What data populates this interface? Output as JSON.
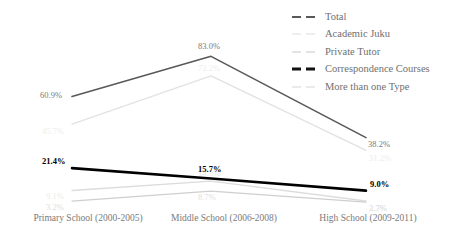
{
  "chart_data": {
    "type": "line",
    "title": "",
    "subtitle": "",
    "xlabel": "",
    "ylabel": "",
    "grid": false,
    "legend_position": "top-right",
    "ylim": [
      0,
      100
    ],
    "categories": [
      "Primary School (2000-2005)",
      "Middle School (2006-2008)",
      "High School (2009-2011)"
    ],
    "series": [
      {
        "name": "Total",
        "color": "#595959",
        "width": 1.6,
        "values": [
          60.9,
          83.0,
          38.2
        ],
        "labels": [
          "60.9%",
          "83.0%",
          "38.2%"
        ],
        "label_color": "#7a7a7a",
        "bold": false
      },
      {
        "name": "Academic Juku",
        "color": "#e2e2e2",
        "width": 1.4,
        "values": [
          45.7,
          72.2,
          31.2
        ],
        "labels": [
          "45.7%",
          "72.2%",
          "31.2%"
        ],
        "label_color": "#ededed",
        "bold": false
      },
      {
        "name": "Private Tutor",
        "color": "#dcdcdc",
        "width": 1.3,
        "values": [
          9.1,
          14.3,
          3.3
        ],
        "labels": [
          "9.1%",
          "14.3%",
          "3.3%"
        ],
        "label_color": "#ebebeb",
        "bold": false
      },
      {
        "name": "Correspondence Courses",
        "color": "#000000",
        "width": 2.6,
        "values": [
          21.4,
          15.7,
          9.0
        ],
        "labels": [
          "21.4%",
          "15.7%",
          "9.0%"
        ],
        "label_color": "#000000",
        "bold": true
      },
      {
        "name": "More than one Type",
        "color": "#cfcfcf",
        "width": 1.3,
        "values": [
          3.2,
          8.7,
          2.7
        ],
        "labels": [
          "3.2%",
          "8.7%",
          "2.7%"
        ],
        "label_color": "#e0e0e0",
        "bold": false
      }
    ]
  },
  "legend": {
    "items": [
      {
        "label": "Total",
        "color": "#595959",
        "thickness": 2
      },
      {
        "label": "Academic Juku",
        "color": "#dedede",
        "thickness": 1.5
      },
      {
        "label": "Private Tutor",
        "color": "#c8c8c8",
        "thickness": 1.5
      },
      {
        "label": "Correspondence Courses",
        "color": "#111111",
        "thickness": 3
      },
      {
        "label": "More than one Type",
        "color": "#d5d5d5",
        "thickness": 1.5
      }
    ]
  },
  "axis": {
    "x_tick_labels": [
      "Primary School (2000-2005)",
      "Middle School (2006-2008)",
      "High School (2009-2011)"
    ],
    "x_tick_positions": [
      88,
      224,
      368
    ]
  },
  "geometry": {
    "x_positions": [
      72,
      211,
      366
    ],
    "plot_top": 40,
    "plot_bottom": 207,
    "value_max": 92,
    "value_min": 0
  }
}
